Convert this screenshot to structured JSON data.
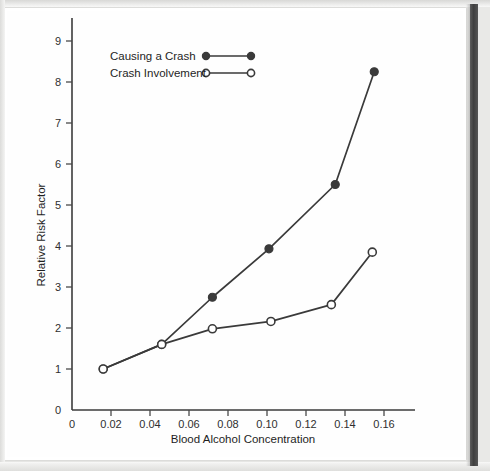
{
  "chart_data": {
    "type": "line",
    "title": "",
    "xlabel": "Blood Alcohol Concentration",
    "ylabel": "Relative Risk Factor",
    "xlim": [
      0,
      0.174
    ],
    "ylim": [
      0,
      9.4
    ],
    "xticks": [
      0,
      0.02,
      0.04,
      0.06,
      0.08,
      0.1,
      0.12,
      0.14,
      0.16
    ],
    "xtick_labels": [
      "0",
      "0.02",
      "0.04",
      "0.06",
      "0.08",
      "0.10",
      "0.12",
      "0.14",
      "0.16"
    ],
    "yticks": [
      0,
      1,
      2,
      3,
      4,
      5,
      6,
      7,
      8,
      9
    ],
    "ytick_labels": [
      "0",
      "1",
      "2",
      "3",
      "4",
      "5",
      "6",
      "7",
      "8",
      "9"
    ],
    "grid": false,
    "legend_position": "top-left",
    "series": [
      {
        "name": "Causing a Crash",
        "marker": "filled-circle",
        "color": "#3a3a3a",
        "x": [
          0.016,
          0.046,
          0.072,
          0.101,
          0.135,
          0.155
        ],
        "values": [
          1.0,
          1.6,
          2.75,
          3.93,
          5.5,
          8.25
        ]
      },
      {
        "name": "Crash Involvement",
        "marker": "open-circle",
        "color": "#3a3a3a",
        "x": [
          0.016,
          0.046,
          0.072,
          0.102,
          0.133,
          0.154
        ],
        "values": [
          1.0,
          1.6,
          1.98,
          2.16,
          2.57,
          3.85
        ]
      }
    ]
  },
  "legend": {
    "items": [
      {
        "label": "Causing a Crash",
        "marker": "filled-circle"
      },
      {
        "label": "Crash Involvement",
        "marker": "open-circle"
      }
    ]
  },
  "axes": {
    "x_title": "Blood Alcohol Concentration",
    "y_title": "Relative Risk Factor"
  },
  "colors": {
    "ink": "#3a3a3a",
    "page": "#fefefe",
    "spine": "#3f3f3f"
  }
}
